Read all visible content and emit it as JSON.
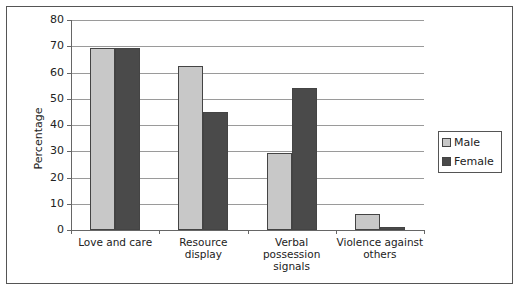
{
  "chart_data": {
    "type": "bar",
    "title": "",
    "xlabel": "",
    "ylabel": "Percentage",
    "ylim": [
      0,
      80
    ],
    "yticks": [
      0,
      10,
      20,
      30,
      40,
      50,
      60,
      70,
      80
    ],
    "grid": true,
    "legend_position": "right",
    "categories": [
      "Love and care",
      "Resource display",
      "Verbal possession signals",
      "Violence against others"
    ],
    "category_lines": [
      [
        "Love and care"
      ],
      [
        "Resource",
        "display"
      ],
      [
        "Verbal",
        "possession",
        "signals"
      ],
      [
        "Violence against",
        "others"
      ]
    ],
    "series": [
      {
        "name": "Male",
        "color": "#c8c8c8",
        "values": [
          69.5,
          62.5,
          29.5,
          6
        ]
      },
      {
        "name": "Female",
        "color": "#4a4a4a",
        "values": [
          69.5,
          45,
          54,
          1
        ]
      }
    ]
  }
}
